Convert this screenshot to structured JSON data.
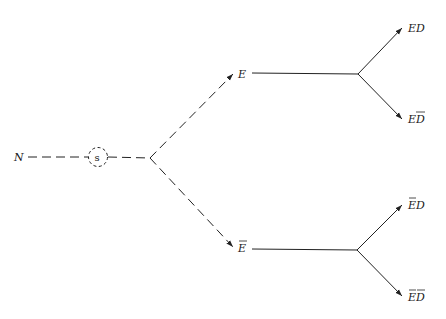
{
  "diagram": {
    "type": "probability-tree",
    "root": {
      "label": "N"
    },
    "chance_node": {
      "label": "s"
    },
    "branches": [
      {
        "label": "E",
        "overline": false,
        "style": "dashed",
        "outcomes": [
          {
            "label": "ED",
            "overline": "none"
          },
          {
            "label": "ED",
            "overline": "D"
          }
        ]
      },
      {
        "label": "E",
        "overline": true,
        "style": "dashed",
        "outcomes": [
          {
            "label": "ED",
            "overline": "E"
          },
          {
            "label": "ED",
            "overline": "both"
          }
        ]
      }
    ],
    "colors": {
      "ink": "#222222",
      "background": "#ffffff"
    }
  }
}
